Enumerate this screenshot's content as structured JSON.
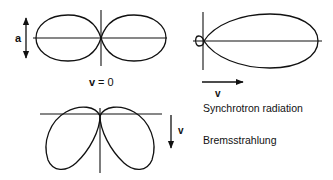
{
  "figure": {
    "dipole": {
      "amplitude_label": "a",
      "velocity_label": "v",
      "velocity_eq": "= 0"
    },
    "synchrotron": {
      "velocity_label": "v",
      "caption": "Synchrotron radiation"
    },
    "bremsstrahlung": {
      "velocity_label": "v",
      "caption": "Bremsstrahlung"
    },
    "colors": {
      "ink": "#111111",
      "background": "#ffffff"
    }
  }
}
